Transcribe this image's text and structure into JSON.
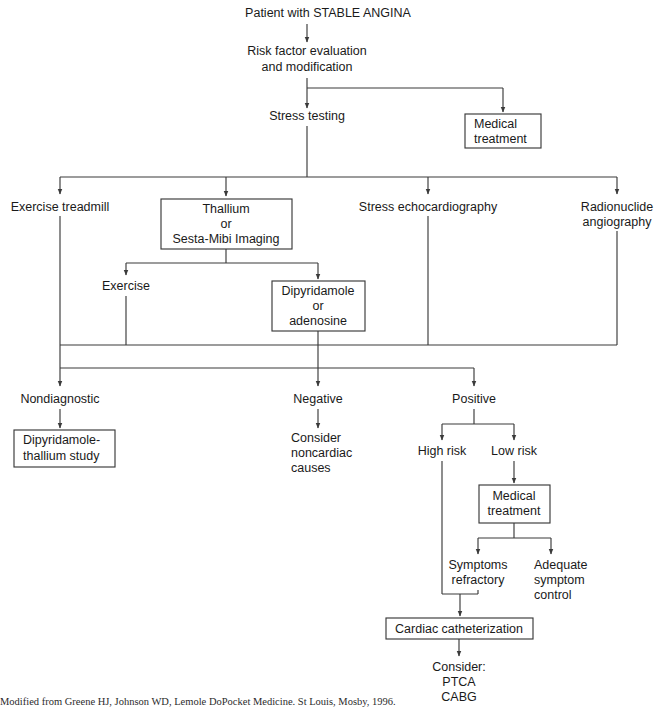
{
  "diagram": {
    "colors": {
      "line": "#3a3a3a",
      "text": "#1a1a1a",
      "background": "#ffffff"
    },
    "nodes": {
      "start": "Patient with STABLE ANGINA",
      "risk_factor_l1": "Risk factor evaluation",
      "risk_factor_l2": "and modification",
      "stress_testing": "Stress testing",
      "medical_treatment_top_l1": "Medical",
      "medical_treatment_top_l2": "treatment",
      "exercise_treadmill": "Exercise treadmill",
      "thallium_l1": "Thallium",
      "thallium_l2": "or",
      "thallium_l3": "Sesta-Mibi Imaging",
      "stress_echo": "Stress echocardiography",
      "radionuclide_l1": "Radionuclide",
      "radionuclide_l2": "angiography",
      "exercise": "Exercise",
      "dipyridamole_l1": "Dipyridamole",
      "dipyridamole_l2": "or",
      "dipyridamole_l3": "adenosine",
      "nondiagnostic": "Nondiagnostic",
      "dip_thallium_l1": "Dipyridamole-",
      "dip_thallium_l2": "thallium study",
      "negative": "Negative",
      "consider_l1": "Consider",
      "consider_l2": "noncardiac",
      "consider_l3": "causes",
      "positive": "Positive",
      "high_risk": "High risk",
      "low_risk": "Low risk",
      "medical_treatment_bot_l1": "Medical",
      "medical_treatment_bot_l2": "treatment",
      "symptoms_refractory_l1": "Symptoms",
      "symptoms_refractory_l2": "refractory",
      "adequate_l1": "Adequate",
      "adequate_l2": "symptom",
      "adequate_l3": "control",
      "cardiac_cath": "Cardiac catheterization",
      "consider_final_l1": "Consider:",
      "consider_final_l2": "PTCA",
      "consider_final_l3": "CABG"
    },
    "caption": "Modified from Greene HJ, Johnson WD, Lemole DoPocket Medicine. St Louis, Mosby, 1996."
  }
}
